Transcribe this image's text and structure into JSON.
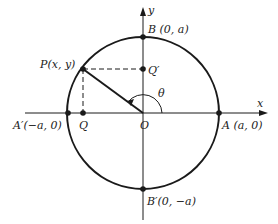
{
  "diagram": {
    "colors": {
      "ink": "#1a1a1a",
      "background": "#ffffff"
    },
    "axes": {
      "x_label": "x",
      "y_label": "y"
    },
    "angle_label": "θ",
    "points": {
      "P": "P(x, y)",
      "Q": "Q",
      "Q_prime": "Q′",
      "O": "O",
      "A": "A (a, 0)",
      "A_prime": "A′(−a, 0)",
      "B": "B (0, a)",
      "B_prime": "B′(0, −a)"
    }
  }
}
